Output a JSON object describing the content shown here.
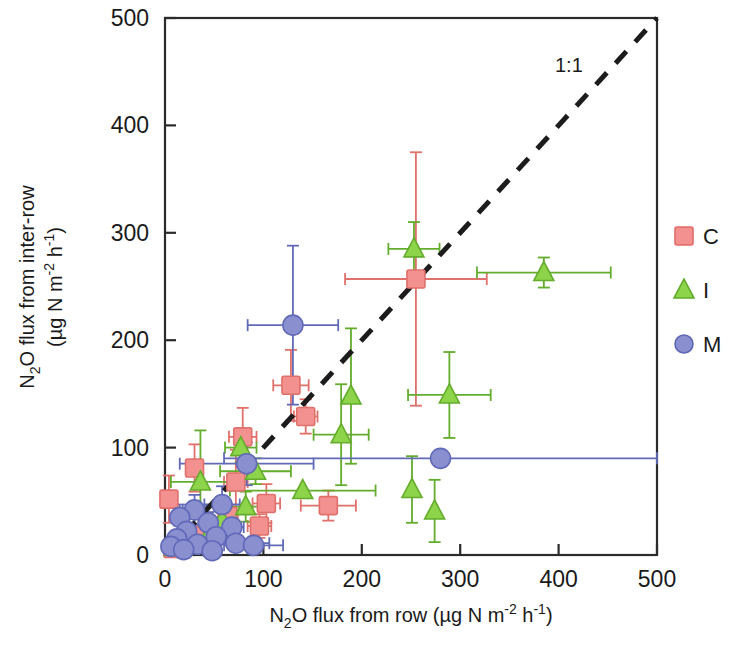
{
  "figure": {
    "title": "",
    "background_color": "#ffffff"
  },
  "axes": {
    "x": {
      "label_parts": [
        "N",
        "2",
        "O flux from row (µg N m",
        "-2",
        " h",
        "-1",
        ")"
      ],
      "label_text": "N2O flux from row (µg N m-2 h-1)",
      "ticks": [
        "0",
        "100",
        "200",
        "300",
        "400",
        "500"
      ],
      "min": 0,
      "max": 500
    },
    "y": {
      "label_line1_parts": [
        "N",
        "2",
        "O flux from inter-row"
      ],
      "label_line1_text": "N2O flux from inter-row",
      "label_line2_parts": [
        "(µg N m",
        "-2",
        " h",
        "-1",
        ")"
      ],
      "label_line2_text": "(µg N m-2 h-1)",
      "ticks": [
        "0",
        "100",
        "200",
        "300",
        "400",
        "500"
      ],
      "min": 0,
      "max": 500
    }
  },
  "annotations": [
    {
      "name": "one-to-one-line-label",
      "text": "1:1",
      "x": 420,
      "y": 450
    }
  ],
  "legend": {
    "position": "right",
    "items": [
      {
        "label": "C",
        "marker": "square",
        "color": "#f2918f",
        "edge": "#e06b66"
      },
      {
        "label": "I",
        "marker": "triangle",
        "color": "#8ed44a",
        "edge": "#5faa2a"
      },
      {
        "label": "M",
        "marker": "circle",
        "color": "#8a8fd0",
        "edge": "#5f66b5"
      }
    ]
  },
  "chart_data": {
    "type": "scatter",
    "title": "",
    "xlabel": "N2O flux from row (µg N m-2 h-1)",
    "ylabel": "N2O flux from inter-row (µg N m-2 h-1)",
    "xlim": [
      0,
      500
    ],
    "ylim": [
      0,
      500
    ],
    "grid": false,
    "legend_position": "right",
    "reference_line": {
      "type": "1:1",
      "style": "dashed",
      "from": [
        0,
        0
      ],
      "to": [
        500,
        500
      ],
      "label": "1:1"
    },
    "series": [
      {
        "name": "C",
        "marker": "square",
        "color": "#f2918f",
        "points": [
          {
            "x": 255,
            "y": 257,
            "xerr": 72,
            "yerr": 118
          },
          {
            "x": 128,
            "y": 158,
            "xerr": 18,
            "yerr": 33
          },
          {
            "x": 143,
            "y": 129,
            "xerr": 12,
            "yerr": 16
          },
          {
            "x": 79,
            "y": 110,
            "xerr": 14,
            "yerr": 27
          },
          {
            "x": 30,
            "y": 81,
            "xerr": 8,
            "yerr": 22
          },
          {
            "x": 72,
            "y": 68,
            "xerr": 12,
            "yerr": 30
          },
          {
            "x": 4,
            "y": 52,
            "xerr": 4,
            "yerr": 22
          },
          {
            "x": 103,
            "y": 48,
            "xerr": 14,
            "yerr": 18
          },
          {
            "x": 166,
            "y": 46,
            "xerr": 28,
            "yerr": 14
          },
          {
            "x": 96,
            "y": 27,
            "xerr": 12,
            "yerr": 11
          },
          {
            "x": 64,
            "y": 36,
            "xerr": 10,
            "yerr": 10
          },
          {
            "x": 40,
            "y": 18,
            "xerr": 8,
            "yerr": 8
          },
          {
            "x": 18,
            "y": 12,
            "xerr": 6,
            "yerr": 7
          },
          {
            "x": 8,
            "y": 6,
            "xerr": 4,
            "yerr": 5
          }
        ]
      },
      {
        "name": "I",
        "marker": "triangle",
        "color": "#8ed44a",
        "points": [
          {
            "x": 253,
            "y": 285,
            "xerr": 26,
            "yerr": 25
          },
          {
            "x": 385,
            "y": 263,
            "xerr": 68,
            "yerr": 14
          },
          {
            "x": 189,
            "y": 148,
            "xerr": 0,
            "yerr": 63
          },
          {
            "x": 289,
            "y": 149,
            "xerr": 42,
            "yerr": 40
          },
          {
            "x": 179,
            "y": 112,
            "xerr": 28,
            "yerr": 47
          },
          {
            "x": 77,
            "y": 100,
            "xerr": 16,
            "yerr": 14
          },
          {
            "x": 92,
            "y": 78,
            "xerr": 36,
            "yerr": 12
          },
          {
            "x": 36,
            "y": 68,
            "xerr": 30,
            "yerr": 48
          },
          {
            "x": 251,
            "y": 61,
            "xerr": 0,
            "yerr": 31
          },
          {
            "x": 274,
            "y": 41,
            "xerr": 0,
            "yerr": 29
          },
          {
            "x": 140,
            "y": 60,
            "xerr": 74,
            "yerr": 0
          },
          {
            "x": 82,
            "y": 45,
            "xerr": 18,
            "yerr": 14
          },
          {
            "x": 58,
            "y": 32,
            "xerr": 14,
            "yerr": 10
          },
          {
            "x": 46,
            "y": 21,
            "xerr": 10,
            "yerr": 9
          },
          {
            "x": 24,
            "y": 14,
            "xerr": 8,
            "yerr": 7
          },
          {
            "x": 10,
            "y": 7,
            "xerr": 5,
            "yerr": 5
          }
        ]
      },
      {
        "name": "M",
        "marker": "circle",
        "color": "#8a8fd0",
        "points": [
          {
            "x": 130,
            "y": 214,
            "xerr": 46,
            "yerr": 74
          },
          {
            "x": 280,
            "y": 90,
            "xerr": 220,
            "yerr": 0
          },
          {
            "x": 83,
            "y": 85,
            "xerr": 68,
            "yerr": 20
          },
          {
            "x": 58,
            "y": 47,
            "xerr": 18,
            "yerr": 17
          },
          {
            "x": 30,
            "y": 42,
            "xerr": 12,
            "yerr": 14
          },
          {
            "x": 15,
            "y": 35,
            "xerr": 8,
            "yerr": 12
          },
          {
            "x": 44,
            "y": 30,
            "xerr": 10,
            "yerr": 10
          },
          {
            "x": 68,
            "y": 26,
            "xerr": 12,
            "yerr": 9
          },
          {
            "x": 22,
            "y": 22,
            "xerr": 8,
            "yerr": 8
          },
          {
            "x": 52,
            "y": 17,
            "xerr": 9,
            "yerr": 7
          },
          {
            "x": 12,
            "y": 15,
            "xerr": 6,
            "yerr": 6
          },
          {
            "x": 33,
            "y": 10,
            "xerr": 7,
            "yerr": 6
          },
          {
            "x": 72,
            "y": 11,
            "xerr": 34,
            "yerr": 5
          },
          {
            "x": 90,
            "y": 9,
            "xerr": 30,
            "yerr": 5
          },
          {
            "x": 6,
            "y": 8,
            "xerr": 4,
            "yerr": 5
          },
          {
            "x": 19,
            "y": 5,
            "xerr": 6,
            "yerr": 4
          },
          {
            "x": 48,
            "y": 4,
            "xerr": 8,
            "yerr": 4
          }
        ]
      }
    ]
  }
}
